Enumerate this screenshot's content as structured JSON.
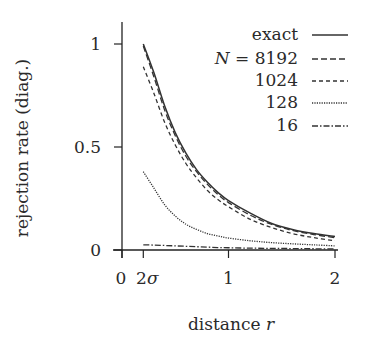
{
  "chart_data": {
    "type": "line",
    "title": "",
    "xlabel": "distance r",
    "xlabel_text": "distance ",
    "xlabel_var": "r",
    "ylabel": "rejection rate (diag.)",
    "xlim": [
      0,
      2
    ],
    "ylim": [
      0,
      1.1
    ],
    "xticks": [
      {
        "value": 0,
        "label": "0"
      },
      {
        "value": 0.2,
        "label": "2σ"
      },
      {
        "value": 1,
        "label": "1"
      },
      {
        "value": 2,
        "label": "2"
      }
    ],
    "yticks": [
      {
        "value": 0,
        "label": "0"
      },
      {
        "value": 0.5,
        "label": "0.5"
      },
      {
        "value": 1,
        "label": "1"
      }
    ],
    "grid": false,
    "legend_position": "upper right",
    "x": [
      0.2,
      0.3,
      0.4,
      0.5,
      0.6,
      0.7,
      0.8,
      0.9,
      1.0,
      1.2,
      1.4,
      1.6,
      1.8,
      2.0
    ],
    "series": [
      {
        "name": "exact",
        "legend": "exact",
        "dash": "",
        "values": [
          1.0,
          0.86,
          0.7,
          0.57,
          0.47,
          0.39,
          0.33,
          0.28,
          0.24,
          0.18,
          0.13,
          0.1,
          0.08,
          0.065
        ]
      },
      {
        "name": "N = 8192",
        "legend_prefix": "N",
        "legend": " = 8192",
        "dash": "6,3",
        "values": [
          0.99,
          0.84,
          0.68,
          0.555,
          0.455,
          0.38,
          0.32,
          0.27,
          0.23,
          0.17,
          0.125,
          0.095,
          0.075,
          0.06
        ]
      },
      {
        "name": "N = 1024",
        "legend": "1024",
        "dash": "4,3",
        "values": [
          0.89,
          0.76,
          0.62,
          0.51,
          0.42,
          0.35,
          0.29,
          0.245,
          0.21,
          0.15,
          0.11,
          0.08,
          0.06,
          0.045
        ]
      },
      {
        "name": "N = 128",
        "legend": "128",
        "dash": "1.2,1.2",
        "values": [
          0.38,
          0.3,
          0.22,
          0.165,
          0.125,
          0.1,
          0.08,
          0.068,
          0.058,
          0.045,
          0.036,
          0.03,
          0.025,
          0.02
        ]
      },
      {
        "name": "N = 16",
        "legend": "16",
        "dash": "6,2,1.5,2",
        "values": [
          0.025,
          0.024,
          0.022,
          0.02,
          0.018,
          0.016,
          0.014,
          0.012,
          0.011,
          0.009,
          0.008,
          0.007,
          0.006,
          0.005
        ]
      }
    ]
  }
}
